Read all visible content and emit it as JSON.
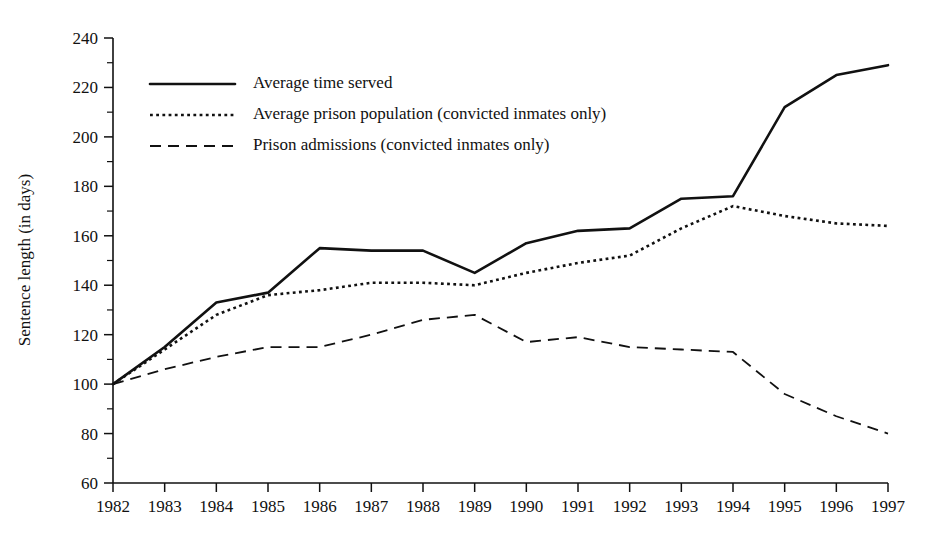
{
  "chart_data": {
    "type": "line",
    "title": "",
    "xlabel": "",
    "ylabel": "Sentence length (in days)",
    "x": [
      1982,
      1983,
      1984,
      1985,
      1986,
      1987,
      1988,
      1989,
      1990,
      1991,
      1992,
      1993,
      1994,
      1995,
      1996,
      1997
    ],
    "xtick_labels": [
      "1982",
      "1983",
      "1984",
      "1985",
      "1986",
      "1987",
      "1988",
      "1989",
      "1990",
      "1991",
      "1992",
      "1993",
      "1994",
      "1995",
      "1996",
      "1997"
    ],
    "ytick_labels": [
      "60",
      "80",
      "100",
      "120",
      "140",
      "160",
      "180",
      "200",
      "220",
      "240"
    ],
    "ytick_values": [
      60,
      80,
      100,
      120,
      140,
      160,
      180,
      200,
      220,
      240
    ],
    "yminor_values": [
      70,
      90,
      110,
      130,
      150,
      170,
      190,
      210,
      230
    ],
    "ylim": [
      60,
      240
    ],
    "xlim": [
      1982,
      1997
    ],
    "grid": false,
    "legend_position": "upper-left",
    "series": [
      {
        "name": "Average time served",
        "style": "solid",
        "color": "#111111",
        "values": [
          100,
          115,
          133,
          137,
          155,
          154,
          154,
          145,
          157,
          162,
          163,
          175,
          176,
          212,
          225,
          229
        ]
      },
      {
        "name": "Average prison population (convicted inmates only)",
        "style": "dotted",
        "color": "#111111",
        "values": [
          100,
          114,
          128,
          136,
          138,
          141,
          141,
          140,
          145,
          149,
          152,
          163,
          172,
          168,
          165,
          164
        ]
      },
      {
        "name": "Prison admissions (convicted inmates only)",
        "style": "dashed",
        "color": "#111111",
        "values": [
          100,
          106,
          111,
          115,
          115,
          120,
          126,
          128,
          117,
          119,
          115,
          114,
          113,
          96,
          87,
          80
        ]
      }
    ]
  },
  "legend": {
    "entries": [
      {
        "label": "Average time served",
        "style": "solid"
      },
      {
        "label": "Average prison population (convicted inmates only)",
        "style": "dotted"
      },
      {
        "label": "Prison admissions (convicted inmates only)",
        "style": "dashed"
      }
    ]
  }
}
